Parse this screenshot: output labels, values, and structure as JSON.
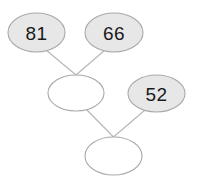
{
  "diagram": {
    "type": "number-pyramid",
    "background_color": "#ffffff",
    "filled_node_color": "#e7e7e7",
    "empty_node_color": "#ffffff",
    "node_border_color": "#a9a9a9",
    "connector_color": "#b5b5b5",
    "text_color": "#1a1a1a",
    "nodes": [
      {
        "id": "node-top-left",
        "value": "81",
        "filled": true,
        "cx": 36.5,
        "cy": 32.5,
        "rx": 28.5,
        "ry": 19.5
      },
      {
        "id": "node-top-right",
        "value": "66",
        "filled": true,
        "cx": 114,
        "cy": 32.5,
        "rx": 29,
        "ry": 19.5
      },
      {
        "id": "node-middle-left",
        "value": "",
        "filled": false,
        "cx": 76,
        "cy": 93,
        "rx": 28,
        "ry": 18
      },
      {
        "id": "node-middle-right",
        "value": "52",
        "filled": true,
        "cx": 156.5,
        "cy": 93.5,
        "rx": 28.5,
        "ry": 18.5
      },
      {
        "id": "node-bottom",
        "value": "",
        "filled": false,
        "cx": 113.5,
        "cy": 156,
        "rx": 28.5,
        "ry": 19
      }
    ],
    "connectors": [
      {
        "id": "connector-top-left-to-middle-left",
        "x1": 46,
        "y1": 50,
        "x2": 76,
        "y2": 75
      },
      {
        "id": "connector-top-right-to-middle-left",
        "x1": 105,
        "y1": 50,
        "x2": 76,
        "y2": 75
      },
      {
        "id": "connector-middle-left-to-bottom",
        "x1": 86,
        "y1": 109,
        "x2": 113.5,
        "y2": 137
      },
      {
        "id": "connector-middle-right-to-bottom",
        "x1": 145,
        "y1": 110,
        "x2": 113.5,
        "y2": 137
      }
    ]
  }
}
